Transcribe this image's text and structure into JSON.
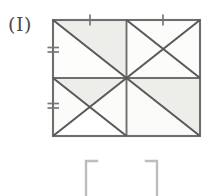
{
  "figure": {
    "label": "(I)",
    "type": "geometry-diagram",
    "colors": {
      "stroke": "#585858",
      "outline": "#6e6e6e",
      "shade": "#ededea",
      "background": "#ffffff",
      "label": "#4a4a4a",
      "bracket": "#b9b9b9"
    },
    "rectangle": {
      "left": 53,
      "top": 20,
      "right": 200,
      "bottom": 136,
      "width": 147,
      "height": 116,
      "center_x": 126.5,
      "center_y": 78
    },
    "quadrants": [
      {
        "name": "top-left",
        "diagonals": "main",
        "shaded_region": "upper-right-triangle"
      },
      {
        "name": "top-right",
        "diagonals": "both",
        "shaded_region": "none"
      },
      {
        "name": "bottom-left",
        "diagonals": "both",
        "shaded_region": "top-triangle"
      },
      {
        "name": "bottom-right",
        "diagonals": "main",
        "shaded_region": "upper-right-triangle"
      }
    ],
    "tick_marks": [
      {
        "name": "top-left-half-tick",
        "edge": "top",
        "x": 90,
        "y": 20,
        "count": 1
      },
      {
        "name": "top-right-half-tick",
        "edge": "top",
        "x": 163,
        "y": 20,
        "count": 1
      },
      {
        "name": "left-upper-half-tick",
        "edge": "left",
        "x": 53,
        "y": 50,
        "count": 2
      },
      {
        "name": "left-lower-half-tick",
        "edge": "left",
        "x": 53,
        "y": 106,
        "count": 2
      }
    ],
    "brackets": [
      {
        "name": "left-bracket",
        "glyph": "[",
        "x": 87,
        "y": 161
      },
      {
        "name": "right-bracket",
        "glyph": "]",
        "x": 155,
        "y": 161
      }
    ]
  }
}
